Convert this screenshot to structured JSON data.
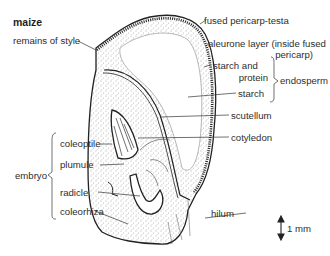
{
  "title": "maize",
  "labels": {
    "remains_of_style": "remains of style",
    "fused_pericarp_testa": "fused pericarp-testa",
    "aleurone_line1": "aleurone layer (inside fused",
    "aleurone_line2": "pericarp)",
    "starch_and": "starch and",
    "protein": "protein",
    "endosperm": "endosperm",
    "starch": "starch",
    "scutellum": "scutellum",
    "cotyledon": "cotyledon",
    "coleoptile": "coleoptile",
    "plumule": "plumule",
    "embryo": "embryo",
    "radicle": "radicle",
    "coleorhiza": "coleorhiza",
    "hilum": "hilum"
  },
  "scale_bar": {
    "label": "1 mm"
  },
  "colors": {
    "line": "#2a2a2a",
    "stipple": "#6a6a6a",
    "background": "#ffffff"
  }
}
